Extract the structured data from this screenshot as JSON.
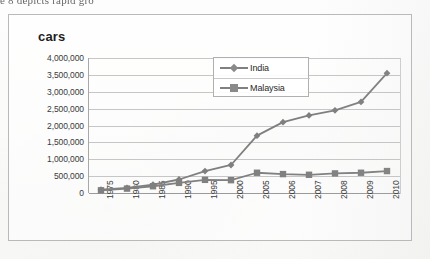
{
  "page": {
    "cutoff_text": "e 8 depicts rapid gro"
  },
  "chart_box": {
    "y_axis_title": "cars"
  },
  "legend": {
    "position": "inside-top-center",
    "entries": [
      {
        "label": "India",
        "marker": "diamond",
        "color": "#7f7f7f"
      },
      {
        "label": "Malaysia",
        "marker": "square",
        "color": "#808080"
      }
    ]
  },
  "chart_data": {
    "type": "line",
    "title": "",
    "subtitle": "",
    "xlabel": "",
    "ylabel": "cars",
    "grid": true,
    "legend_position": "inside-top-center",
    "categories": [
      "1975",
      "1980",
      "1985",
      "1990",
      "1995",
      "2000",
      "2005",
      "2006",
      "2007",
      "2008",
      "2009",
      "2010"
    ],
    "ytick_labels": [
      "0",
      "500,000",
      "1,000,000",
      "1,500,000",
      "2,000,000",
      "2,500,000",
      "3,000,000",
      "3,500,000",
      "4,000,000"
    ],
    "ytick_values": [
      0,
      500000,
      1000000,
      1500000,
      2000000,
      2500000,
      3000000,
      3500000,
      4000000
    ],
    "ylim": [
      0,
      4000000
    ],
    "series": [
      {
        "name": "India",
        "marker": "diamond",
        "color": "#7f7f7f",
        "values": [
          100000,
          150000,
          250000,
          400000,
          650000,
          830000,
          1700000,
          2100000,
          2300000,
          2450000,
          2700000,
          3550000
        ]
      },
      {
        "name": "Malaysia",
        "marker": "square",
        "color": "#808080",
        "values": [
          80000,
          130000,
          200000,
          300000,
          390000,
          380000,
          600000,
          560000,
          540000,
          580000,
          600000,
          650000
        ]
      }
    ]
  }
}
